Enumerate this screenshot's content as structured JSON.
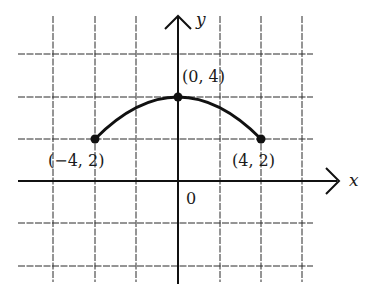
{
  "diagram": {
    "type": "coordinate-plane",
    "axes": {
      "x_label": "x",
      "y_label": "y",
      "origin_label": "0"
    },
    "grid": {
      "spacing_units": 2,
      "x_range": [
        -8,
        8
      ],
      "y_range": [
        -4,
        6
      ]
    },
    "curve": {
      "description": "arc from (-4, 2) through (0, 4) to (4, 2)"
    },
    "points": [
      {
        "label": "(−4, 2)",
        "x": -4,
        "y": 2
      },
      {
        "label": "(0, 4)",
        "x": 0,
        "y": 4
      },
      {
        "label": "(4, 2)",
        "x": 4,
        "y": 2
      }
    ]
  },
  "colors": {
    "ink": "#111111",
    "background": "#ffffff",
    "grid": "#2a2a2a"
  }
}
